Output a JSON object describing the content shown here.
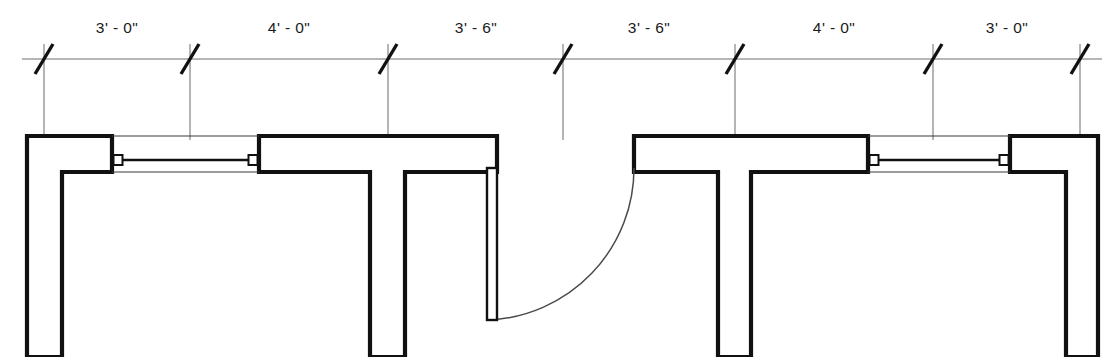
{
  "drawing": {
    "title": "Partition Plan Detail",
    "units": "feet-inches",
    "canvas": {
      "width": 1118,
      "height": 357
    }
  },
  "dimension_string": {
    "name": "overall-dimension-chain",
    "line_y": 59,
    "text_y": 33,
    "segments": [
      {
        "id": "seg-1",
        "label": "3' - 0\"",
        "start_x": 44,
        "end_x": 190,
        "text_x": 117
      },
      {
        "id": "seg-2",
        "label": "4' - 0\"",
        "start_x": 190,
        "end_x": 388,
        "text_x": 289
      },
      {
        "id": "seg-3",
        "label": "3' - 6\"",
        "start_x": 388,
        "end_x": 563,
        "text_x": 476
      },
      {
        "id": "seg-4",
        "label": "3' - 6\"",
        "start_x": 563,
        "end_x": 735,
        "text_x": 649
      },
      {
        "id": "seg-5",
        "label": "4' - 0\"",
        "start_x": 735,
        "end_x": 933,
        "text_x": 834
      },
      {
        "id": "seg-6",
        "label": "3' - 0\"",
        "start_x": 933,
        "end_x": 1080,
        "text_x": 1007
      }
    ],
    "tick_marks": [
      {
        "id": "tick-1",
        "x": 44
      },
      {
        "id": "tick-2",
        "x": 190
      },
      {
        "id": "tick-3",
        "x": 388
      },
      {
        "id": "tick-4",
        "x": 563
      },
      {
        "id": "tick-5",
        "x": 735
      },
      {
        "id": "tick-6",
        "x": 933
      },
      {
        "id": "tick-7",
        "x": 1080
      }
    ],
    "extension_lines": [
      {
        "id": "ext-1",
        "x": 44,
        "y1": 44,
        "y2": 140
      },
      {
        "id": "ext-2",
        "x": 190,
        "y1": 44,
        "y2": 140
      },
      {
        "id": "ext-3",
        "x": 388,
        "y1": 44,
        "y2": 140
      },
      {
        "id": "ext-4",
        "x": 563,
        "y1": 44,
        "y2": 140
      },
      {
        "id": "ext-5",
        "x": 735,
        "y1": 44,
        "y2": 140
      },
      {
        "id": "ext-6",
        "x": 933,
        "y1": 44,
        "y2": 140
      },
      {
        "id": "ext-7",
        "x": 1080,
        "y1": 44,
        "y2": 140
      }
    ],
    "tick_slash": {
      "dx": 9,
      "dy": 15
    }
  },
  "plan_geometry": {
    "wall_face_outer_y": 136,
    "wall_face_inner_y": 172,
    "plan_bottom_y": 357,
    "walls": [
      {
        "id": "wall-left-return",
        "name": "left-wall-assembly",
        "points": "27,136 112,136 112,172 62,172 62,357 27,357"
      },
      {
        "id": "wall-left-pier",
        "name": "left-interior-pier",
        "points": "259,136 497,136 497,172 405,172 405,357 370,357 370,172 259,172"
      },
      {
        "id": "wall-center-right-tee",
        "name": "center-right-tee-wall",
        "points": "634,136 868,136 868,172 751,172 751,357 718,357 718,172 634,172 634,136"
      },
      {
        "id": "wall-right-return",
        "name": "right-wall-assembly",
        "points": "1010,136 1098,136 1098,357 1066,357 1066,172 1010,172"
      }
    ],
    "windows": [
      {
        "id": "window-left",
        "name": "left-window",
        "x1": 112,
        "x2": 259,
        "head_y": 136,
        "sill_y": 172,
        "glass_y": 160,
        "jambs": [
          {
            "x": 118
          },
          {
            "x": 253
          }
        ]
      },
      {
        "id": "window-right",
        "name": "right-window",
        "x1": 868,
        "x2": 1010,
        "head_y": 136,
        "sill_y": 172,
        "glass_y": 160,
        "jambs": [
          {
            "x": 874
          },
          {
            "x": 1004
          }
        ]
      }
    ],
    "door": {
      "id": "door-swing-center",
      "name": "swing-door",
      "leaf_x1": 487,
      "leaf_x2": 497,
      "leaf_y1": 168,
      "leaf_y2": 320,
      "hinge_x": 634,
      "hinge_y": 168,
      "arc_radius": 152,
      "arc_start_x": 634,
      "arc_start_y": 168,
      "arc_end_x": 489,
      "arc_end_y": 320,
      "swing_label": "90-degree-swing"
    }
  }
}
